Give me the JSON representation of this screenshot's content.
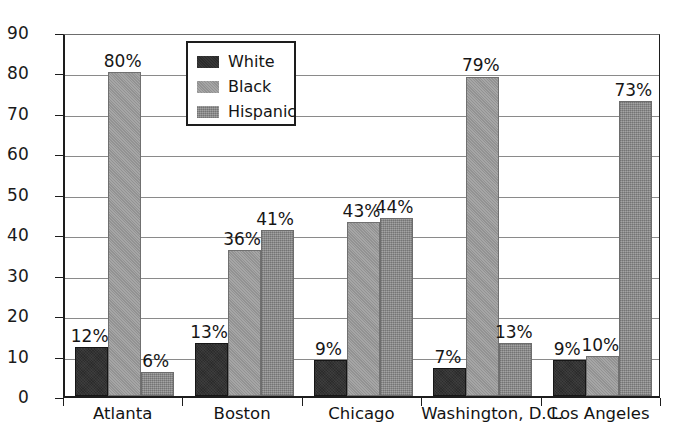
{
  "chart_data": {
    "type": "bar",
    "title": "",
    "xlabel": "",
    "ylabel": "",
    "ylim": [
      0,
      90
    ],
    "ytick_step": 10,
    "yticks": [
      0,
      10,
      20,
      30,
      40,
      50,
      60,
      70,
      80,
      90
    ],
    "grid": true,
    "legend_position": "upper-left-inside",
    "value_label_suffix": "%",
    "categories": [
      "Atlanta",
      "Boston",
      "Chicago",
      "Washington, D.C.",
      "Los Angeles"
    ],
    "series": [
      {
        "name": "White",
        "color": "#2b2b2b",
        "values": [
          12,
          13,
          9,
          7,
          9
        ],
        "labels": [
          "12%",
          "13%",
          "9%",
          "7%",
          "9%"
        ]
      },
      {
        "name": "Black",
        "color": "#9a9a9a",
        "values": [
          80,
          36,
          43,
          79,
          10
        ],
        "labels": [
          "80%",
          "36%",
          "43%",
          "79%",
          "10%"
        ]
      },
      {
        "name": "Hispanic",
        "color": "#8e8e8e",
        "values": [
          6,
          41,
          44,
          13,
          73
        ],
        "labels": [
          "6%",
          "41%",
          "44%",
          "13%",
          "73%"
        ]
      }
    ]
  },
  "legend": {
    "entries": [
      {
        "label": "White",
        "swatch": "series-white"
      },
      {
        "label": "Black",
        "swatch": "series-black"
      },
      {
        "label": "Hispanic",
        "swatch": "series-hispanic"
      }
    ]
  },
  "axis": {
    "y_tick_labels": [
      "90",
      "80",
      "70",
      "60",
      "50",
      "40",
      "30",
      "20",
      "10",
      "0"
    ],
    "x_tick_labels": [
      "Atlanta",
      "Boston",
      "Chicago",
      "Washington, D.C.",
      "Los Angeles"
    ]
  }
}
